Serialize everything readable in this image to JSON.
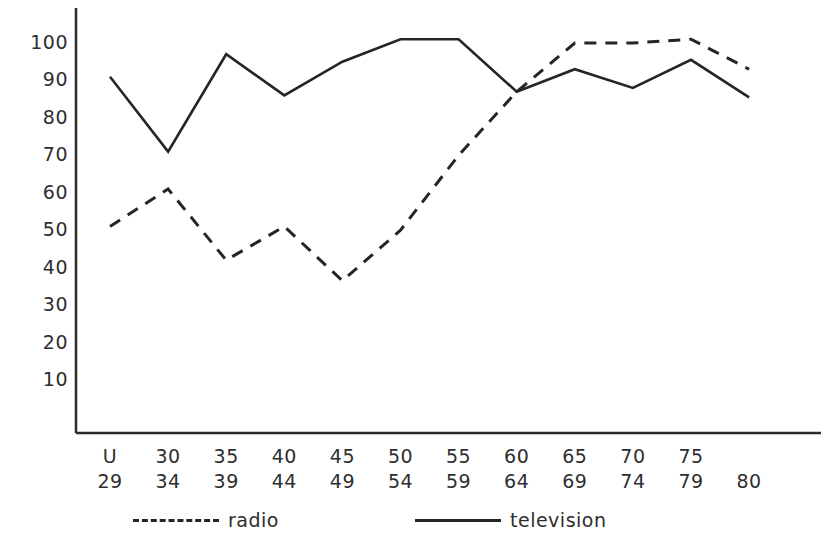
{
  "chart_data": {
    "type": "line",
    "title": "",
    "subtitle": "",
    "xlabel": "",
    "ylabel": "",
    "categories": [
      "U\n29",
      "30\n34",
      "35\n39",
      "40\n44",
      "45\n49",
      "50\n54",
      "55\n59",
      "60\n64",
      "65\n69",
      "70\n74",
      "75\n79",
      "80"
    ],
    "category_parts": [
      {
        "top": "U",
        "bottom": "29"
      },
      {
        "top": "30",
        "bottom": "34"
      },
      {
        "top": "35",
        "bottom": "39"
      },
      {
        "top": "40",
        "bottom": "44"
      },
      {
        "top": "45",
        "bottom": "49"
      },
      {
        "top": "50",
        "bottom": "54"
      },
      {
        "top": "55",
        "bottom": "59"
      },
      {
        "top": "60",
        "bottom": "64"
      },
      {
        "top": "65",
        "bottom": "69"
      },
      {
        "top": "70",
        "bottom": "74"
      },
      {
        "top": "75",
        "bottom": "79"
      },
      {
        "top": "",
        "bottom": "80"
      }
    ],
    "ytick_labels": [
      "100",
      "90",
      "80",
      "70",
      "60",
      "50",
      "40",
      "30",
      "20",
      "10"
    ],
    "ytick_values": [
      100,
      90,
      80,
      70,
      60,
      50,
      40,
      30,
      20,
      10
    ],
    "ylim": [
      0,
      105
    ],
    "grid": false,
    "legend_position": "bottom",
    "series": [
      {
        "name": "radio",
        "style": "dashed",
        "color": "#252525",
        "values": [
          51,
          61,
          42,
          51,
          36.5,
          50,
          70,
          87,
          100,
          100,
          101,
          93
        ]
      },
      {
        "name": "television",
        "style": "solid",
        "color": "#252525",
        "values": [
          91,
          71,
          97,
          86,
          95,
          101,
          101,
          87,
          93,
          88,
          95.5,
          85.5
        ]
      }
    ]
  },
  "legend": {
    "radio_label": "radio",
    "television_label": "television"
  }
}
